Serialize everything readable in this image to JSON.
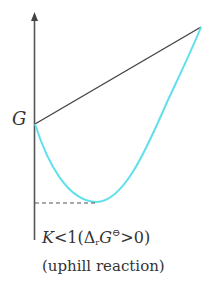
{
  "diagram": {
    "y_axis_label": "G",
    "condition": {
      "k_symbol": "K",
      "relation": "<1(",
      "delta": "Δ",
      "delta_sub": "r",
      "g_symbol": "G",
      "standard_sup": "⊖",
      "tail": ">0)"
    },
    "caption": "(uphill reaction)",
    "colors": {
      "axis": "#555555",
      "straight_line": "#444444",
      "curve": "#5fe0ea",
      "dashed_line": "#555555",
      "text": "#333333"
    },
    "points": {
      "reactants": {
        "x": 35,
        "y": 124
      },
      "products": {
        "x": 201,
        "y": 27
      },
      "minimum": {
        "x": 95,
        "y": 202
      }
    }
  }
}
